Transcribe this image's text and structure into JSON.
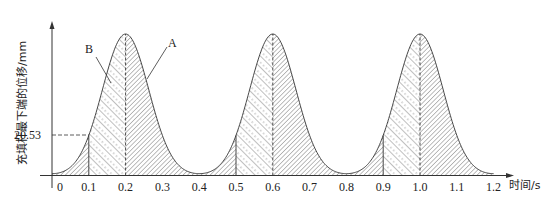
{
  "chart_data": {
    "type": "area",
    "title": "",
    "xlabel": "时间/s",
    "ylabel": "充填杆最下端的位移/mm",
    "x_ticks": [
      "0",
      "0.1",
      "0.2",
      "0.3",
      "0.4",
      "0.5",
      "0.6",
      "0.7",
      "0.8",
      "0.9",
      "1.0",
      "1.1",
      "1.2"
    ],
    "xlim": [
      0,
      1.2
    ],
    "y_marked_value": "20.53",
    "y_marked_at_x": 0.1,
    "period_s": 0.4,
    "peaks_x": [
      0.2,
      0.6,
      1.0
    ],
    "troughs_x": [
      0.0,
      0.4,
      0.8,
      1.2
    ],
    "peak_value_mm_estimate": 72.3,
    "series": [
      {
        "name": "displacement",
        "x": [
          0.0,
          0.05,
          0.1,
          0.15,
          0.2,
          0.25,
          0.3,
          0.35,
          0.4,
          0.45,
          0.5,
          0.55,
          0.6,
          0.65,
          0.7,
          0.75,
          0.8,
          0.85,
          0.9,
          0.95,
          1.0,
          1.05,
          1.1,
          1.15,
          1.2
        ],
        "values": [
          0.5,
          5.0,
          20.53,
          53.0,
          72.3,
          53.0,
          20.53,
          5.0,
          0.5,
          5.0,
          20.53,
          53.0,
          72.3,
          53.0,
          20.53,
          5.0,
          0.5,
          5.0,
          20.53,
          53.0,
          72.3,
          53.0,
          20.53,
          5.0,
          0.5
        ]
      }
    ],
    "regions": [
      {
        "label": "B",
        "description": "sparse backslash hatch with dashed lines",
        "x_ranges": [
          [
            0.1,
            0.2
          ],
          [
            0.5,
            0.6
          ],
          [
            0.9,
            1.0
          ]
        ]
      },
      {
        "label": "A",
        "description": "dense forward-slash hatch",
        "x_ranges": [
          [
            0.0,
            0.1
          ],
          [
            0.2,
            0.5
          ],
          [
            0.6,
            0.9
          ],
          [
            1.0,
            1.2
          ]
        ]
      }
    ],
    "annotations": [
      {
        "text": "A",
        "points_to": "dense hatched region right of peak"
      },
      {
        "text": "B",
        "points_to": "sparse hatched region left of peak"
      }
    ],
    "grid": false,
    "legend": null
  },
  "labels": {
    "y_axis_title": "充填杆最下端的位移/mm",
    "x_axis_title": "时间/s",
    "y_mark": "20.53",
    "callout_a": "A",
    "callout_b": "B"
  }
}
